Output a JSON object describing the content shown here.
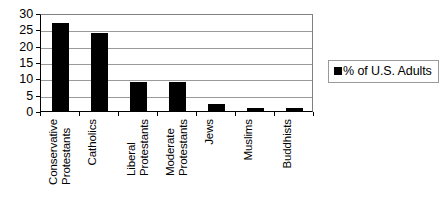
{
  "chart_data": {
    "type": "bar",
    "title": "",
    "subtitle": "",
    "xlabel": "",
    "ylabel": "",
    "categories": [
      "Conservative\nProtestants",
      "Catholics",
      "Liberal\nProtestants",
      "Moderate\nProtestants",
      "Jews",
      "Muslims",
      "Buddhists"
    ],
    "series": [
      {
        "name": "% of U.S. Adults",
        "values": [
          27,
          24,
          9,
          9,
          2,
          1,
          1
        ],
        "color": "#000000"
      }
    ],
    "values": [
      27,
      24,
      9,
      9,
      2,
      1,
      1
    ],
    "ylim": [
      0,
      30
    ],
    "yticks": [
      0,
      5,
      10,
      15,
      20,
      25,
      30
    ],
    "ytick_labels": [
      "0",
      "5",
      "10",
      "15",
      "20",
      "25",
      "30"
    ],
    "grid": "horizontal",
    "legend_position": "right",
    "legend": {
      "entries": [
        {
          "label": "% of U.S. Adults",
          "marker": "square-marker",
          "color": "#000000"
        }
      ]
    },
    "colors": {
      "bar": "#000000",
      "gridline": "#9a9a9a",
      "axis": "#000000",
      "plot_border": "#808080",
      "background": "#ffffff",
      "text": "#000000"
    }
  }
}
